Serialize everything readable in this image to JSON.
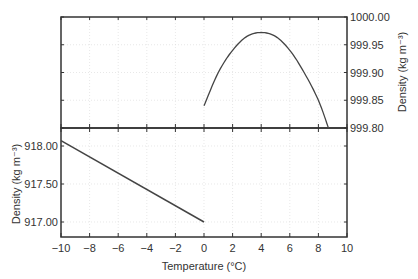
{
  "chart_data": [
    {
      "panel": "upper",
      "type": "line",
      "title": "",
      "xlabel": "Temperature (°C)",
      "ylabel": "Density (kg m⁻³)",
      "ylabel_position": "right",
      "xlim": [
        -10,
        10
      ],
      "ylim": [
        999.8,
        1000.0
      ],
      "x_ticks": [
        -10,
        -8,
        -6,
        -4,
        -2,
        0,
        2,
        4,
        6,
        8,
        10
      ],
      "y_ticks": [
        "999.80",
        "999.85",
        "999.90",
        "999.95",
        "1000.00"
      ],
      "grid": true,
      "series": [
        {
          "name": "Liquid water",
          "x": [
            0,
            1,
            2,
            3,
            4,
            5,
            6,
            7,
            8,
            8.7
          ],
          "values": [
            999.84,
            999.9,
            999.94,
            999.965,
            999.972,
            999.965,
            999.94,
            999.9,
            999.85,
            999.8
          ]
        }
      ]
    },
    {
      "panel": "lower",
      "type": "line",
      "title": "",
      "xlabel": "Temperature (°C)",
      "ylabel": "Density (kg m⁻³)",
      "ylabel_position": "left",
      "xlim": [
        -10,
        10
      ],
      "ylim": [
        916.8,
        918.24
      ],
      "x_ticks": [
        -10,
        -8,
        -6,
        -4,
        -2,
        0,
        2,
        4,
        6,
        8,
        10
      ],
      "y_ticks": [
        "917.00",
        "917.50",
        "918.00"
      ],
      "grid": true,
      "series": [
        {
          "name": "Ice",
          "x": [
            -10,
            0
          ],
          "values": [
            918.07,
            917.0
          ]
        }
      ]
    }
  ],
  "labels": {
    "xlabel": "Temperature (°C)",
    "ylabel_upper": "Density (kg m⁻³)",
    "ylabel_lower": "Density (kg m⁻³)"
  },
  "x_tick_labels": [
    "−10",
    "−8",
    "−6",
    "−4",
    "−2",
    "0",
    "2",
    "4",
    "6",
    "8",
    "10"
  ],
  "colors": {
    "axis": "#333333",
    "line": "#444444",
    "grid": "#d8d8d8"
  }
}
